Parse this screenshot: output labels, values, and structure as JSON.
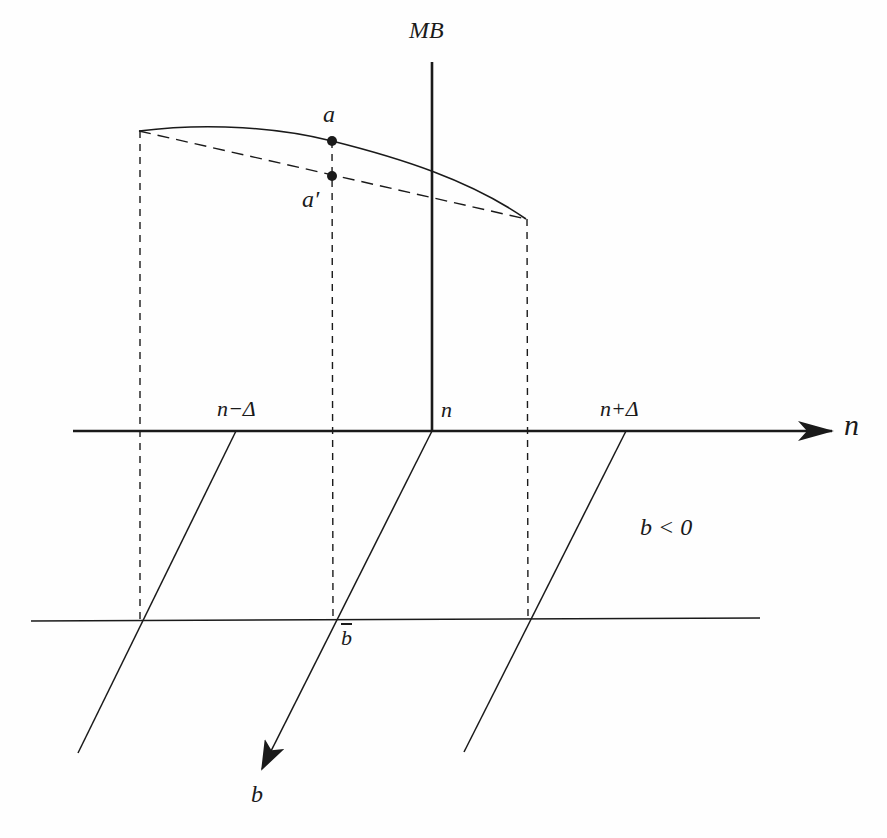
{
  "diagram": {
    "type": "economics-diagram",
    "colors": {
      "line": "#1a1a1a",
      "background": "#fefefe"
    },
    "axes": {
      "vertical_label": "MB",
      "horizontal_label": "n",
      "depth_label": "b"
    },
    "tick_labels": {
      "n_minus": "n−Δ",
      "n_center": "n",
      "n_plus": "n+Δ",
      "b_bar": "b"
    },
    "points": {
      "a": "a",
      "a_prime": "a′"
    },
    "region_label": "b < 0"
  }
}
